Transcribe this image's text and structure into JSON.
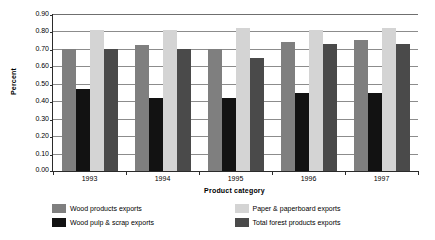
{
  "chart_data": {
    "type": "bar",
    "title": "",
    "xlabel": "Product category",
    "ylabel": "Percent",
    "categories": [
      "1993",
      "1994",
      "1995",
      "1996",
      "1997"
    ],
    "series": [
      {
        "name": "Wood products exports",
        "color": "#7f7f7f",
        "values": [
          0.7,
          0.72,
          0.7,
          0.74,
          0.75
        ]
      },
      {
        "name": "Wood pulp & scrap exports",
        "color": "#121212",
        "values": [
          0.47,
          0.42,
          0.42,
          0.45,
          0.45
        ]
      },
      {
        "name": "Paper & paperboard exports",
        "color": "#d4d4d4",
        "values": [
          0.81,
          0.81,
          0.82,
          0.81,
          0.82
        ]
      },
      {
        "name": "Total forest products exports",
        "color": "#4a4a4a",
        "values": [
          0.7,
          0.7,
          0.65,
          0.73,
          0.73
        ]
      }
    ],
    "ylim": [
      0.0,
      0.9
    ],
    "ytick_labels": [
      "0.90",
      "0.80",
      "0.70",
      "0.60",
      "0.50",
      "0.40",
      "0.30",
      "0.20",
      "0.10",
      "0.00"
    ],
    "ytick_values": [
      0.9,
      0.8,
      0.7,
      0.6,
      0.5,
      0.4,
      0.3,
      0.2,
      0.1,
      0.0
    ],
    "grid": true,
    "legend_position": "bottom"
  },
  "axes": {
    "y_title": "Percent",
    "x_title": "Product category"
  },
  "legend": {
    "items": [
      {
        "label": "Wood products exports",
        "color": "#7f7f7f"
      },
      {
        "label": "Wood pulp & scrap exports",
        "color": "#121212"
      },
      {
        "label": "Paper & paperboard exports",
        "color": "#d4d4d4"
      },
      {
        "label": "Total forest products exports",
        "color": "#4a4a4a"
      }
    ]
  }
}
